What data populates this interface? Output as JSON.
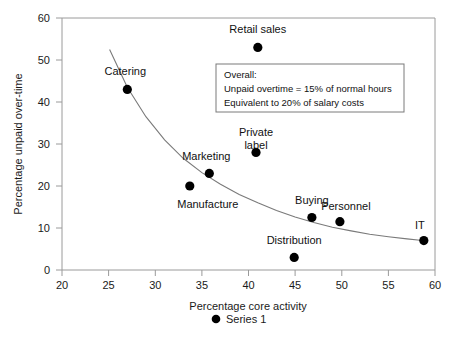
{
  "chart_data": {
    "type": "scatter",
    "title": "",
    "xlabel": "Percentage core activity",
    "ylabel": "Percentage unpaid over-time",
    "xlim": [
      20,
      60
    ],
    "ylim": [
      0,
      60
    ],
    "xticks": [
      "20",
      "25",
      "30",
      "35",
      "40",
      "45",
      "50",
      "55",
      "60"
    ],
    "yticks": [
      "0",
      "10",
      "20",
      "30",
      "40",
      "50",
      "60"
    ],
    "grid": false,
    "legend": {
      "position": "bottom",
      "entries": [
        {
          "label": "Series 1",
          "marker": "filled-circle",
          "color": "#000000"
        }
      ]
    },
    "series": [
      {
        "name": "Series 1",
        "marker_color": "#000000",
        "points": [
          {
            "label": "Catering",
            "x": 27,
            "y": 43,
            "label_dx": -2,
            "label_dy": -14,
            "label_anchor": "middle"
          },
          {
            "label": "Retail sales",
            "x": 41,
            "y": 53,
            "label_dx": 0,
            "label_dy": -14,
            "label_anchor": "middle"
          },
          {
            "label": "Private label",
            "x": 40.8,
            "y": 28,
            "label_dx": 0,
            "label_dy": -16,
            "label_anchor": "middle"
          },
          {
            "label": "Marketing",
            "x": 35.8,
            "y": 23,
            "label_dx": -3,
            "label_dy": -13,
            "label_anchor": "middle"
          },
          {
            "label": "Manufacture",
            "x": 33.7,
            "y": 20,
            "label_dx": 18,
            "label_dy": 22,
            "label_anchor": "middle"
          },
          {
            "label": "Buying",
            "x": 46.8,
            "y": 12.5,
            "label_dx": 0,
            "label_dy": -14,
            "label_anchor": "middle"
          },
          {
            "label": "Personnel",
            "x": 49.8,
            "y": 11.5,
            "label_dx": 6,
            "label_dy": -12,
            "label_anchor": "middle"
          },
          {
            "label": "IT",
            "x": 58.8,
            "y": 7,
            "label_dx": -4,
            "label_dy": -12,
            "label_anchor": "middle"
          },
          {
            "label": "Distribution",
            "x": 44.9,
            "y": 3,
            "label_dx": 0,
            "label_dy": -13,
            "label_anchor": "middle"
          }
        ]
      }
    ],
    "trend_curve": {
      "description": "fitted decreasing power curve through the scatter",
      "points": [
        {
          "x": 25.1,
          "y": 52.5
        },
        {
          "x": 27.0,
          "y": 43.5
        },
        {
          "x": 29.0,
          "y": 36.5
        },
        {
          "x": 31.0,
          "y": 31.0
        },
        {
          "x": 33.0,
          "y": 26.6
        },
        {
          "x": 35.0,
          "y": 23.2
        },
        {
          "x": 37.0,
          "y": 20.4
        },
        {
          "x": 39.0,
          "y": 18.0
        },
        {
          "x": 41.0,
          "y": 16.0
        },
        {
          "x": 43.0,
          "y": 14.2
        },
        {
          "x": 45.0,
          "y": 12.6
        },
        {
          "x": 47.0,
          "y": 11.3
        },
        {
          "x": 49.0,
          "y": 10.2
        },
        {
          "x": 51.0,
          "y": 9.3
        },
        {
          "x": 53.0,
          "y": 8.5
        },
        {
          "x": 55.0,
          "y": 7.9
        },
        {
          "x": 57.0,
          "y": 7.4
        },
        {
          "x": 58.4,
          "y": 7.1
        }
      ]
    },
    "annotation_box": {
      "lines": [
        "Overall:",
        "Unpaid overtime = 15% of normal hours",
        "Equivalent to 20% of salary costs"
      ]
    }
  }
}
